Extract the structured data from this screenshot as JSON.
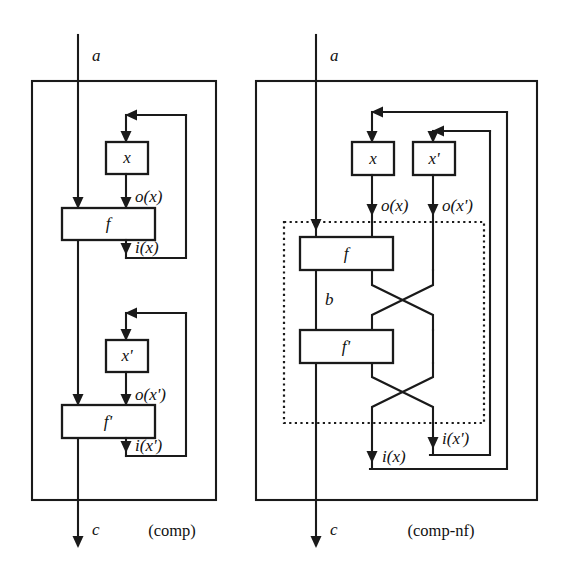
{
  "figure": {
    "background_color": "#ffffff",
    "line_color": "#1a1a1a"
  },
  "diagrams": [
    {
      "id": "comp",
      "caption": "(comp)",
      "input_label": "a",
      "output_label": "c",
      "boxes": [
        {
          "id": "x",
          "label": "x"
        },
        {
          "id": "f",
          "label": "f"
        },
        {
          "id": "xp",
          "label": "x'"
        },
        {
          "id": "fp",
          "label": "f'"
        }
      ],
      "wire_labels": [
        {
          "id": "ox",
          "label": "o(x)"
        },
        {
          "id": "ix",
          "label": "i(x)"
        },
        {
          "id": "oxp",
          "label": "o(x')"
        },
        {
          "id": "ixp",
          "label": "i(x')"
        }
      ]
    },
    {
      "id": "comp-nf",
      "caption": "(comp-nf)",
      "input_label": "a",
      "output_label": "c",
      "internal_label": "b",
      "boxes": [
        {
          "id": "x",
          "label": "x"
        },
        {
          "id": "xp",
          "label": "x'"
        },
        {
          "id": "f",
          "label": "f"
        },
        {
          "id": "fp",
          "label": "f'"
        }
      ],
      "wire_labels": [
        {
          "id": "ox",
          "label": "o(x)"
        },
        {
          "id": "oxp",
          "label": "o(x')"
        },
        {
          "id": "ix",
          "label": "i(x)"
        },
        {
          "id": "ixp",
          "label": "i(x')"
        }
      ]
    }
  ]
}
